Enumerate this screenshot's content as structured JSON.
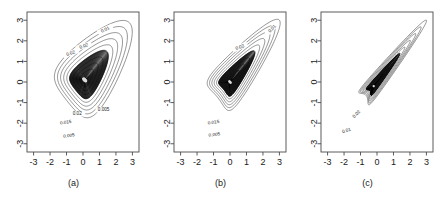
{
  "figure": {
    "type": "contour-plot-panel-figure",
    "panel_count": 3,
    "background_color": "#ffffff",
    "line_color": "#2b2b2b"
  },
  "axes": {
    "x_ticks": [
      "-3",
      "-2",
      "-1",
      "0",
      "1",
      "2",
      "3"
    ],
    "y_ticks": [
      "3",
      "2",
      "1",
      "0",
      "-1",
      "-2",
      "-3"
    ],
    "x_tick_values": [
      -3,
      -2,
      -1,
      0,
      1,
      2,
      3
    ],
    "y_tick_values": [
      3,
      2,
      1,
      0,
      -1,
      -2,
      -3
    ],
    "xlim": [
      -3.4,
      3.4
    ],
    "ylim": [
      -3.4,
      3.4
    ]
  },
  "panels": [
    {
      "id": "a",
      "caption": "(a)",
      "contour_labels": [
        "0.01",
        "0.02",
        "0.02",
        "0.005",
        "0.02",
        "0.015",
        "0.005"
      ]
    },
    {
      "id": "b",
      "caption": "(b)",
      "contour_labels": [
        "0.01",
        "0.02",
        "0.015",
        "0.005"
      ]
    },
    {
      "id": "c",
      "caption": "(c)",
      "contour_labels": [
        "0.02",
        "0.01"
      ]
    }
  ],
  "chart_data": {
    "type": "line",
    "title": "",
    "xlabel": "",
    "ylabel": "",
    "xlim": [
      -3.4,
      3.4
    ],
    "ylim": [
      -3.4,
      3.4
    ],
    "grid": false,
    "legend": "none",
    "plot_kind": "contour",
    "contour_levels": [
      0.005,
      0.01,
      0.015,
      0.02,
      0.025,
      0.03,
      0.035,
      0.04,
      0.05,
      0.06,
      0.08,
      0.1,
      0.12,
      0.15
    ],
    "labeled_levels": [
      0.005,
      0.01,
      0.015,
      0.02
    ],
    "series": [
      {
        "name": "(a)",
        "description": "Broad rounded teardrop density, moderate positive correlation, mode near (0.1, 0.1), tail extending toward (2.8, 2.8)",
        "mode": [
          0.1,
          0.1
        ],
        "correlation": 0.55,
        "sigma_major": 1.55,
        "sigma_minor": 0.95,
        "skew": 0.45,
        "tip": [
          2.85,
          2.85
        ],
        "labels": [
          "0.01",
          "0.02",
          "0.02",
          "0.005",
          "0.02",
          "0.015",
          "0.005"
        ]
      },
      {
        "name": "(b)",
        "description": "Narrower elongated teardrop, strong positive correlation, mode near (0.0, 0.0), tip reaching (3.0, 3.0)",
        "mode": [
          0.0,
          0.0
        ],
        "correlation": 0.8,
        "sigma_major": 1.75,
        "sigma_minor": 0.7,
        "skew": 0.6,
        "tip": [
          3.0,
          3.0
        ],
        "labels": [
          "0.01",
          "0.02",
          "0.015",
          "0.005"
        ]
      },
      {
        "name": "(c)",
        "description": "Very narrow needle-like teardrop, near-perfect positive correlation, concentrated along the diagonal with sharp tip at (3.0, 3.0)",
        "mode": [
          -0.2,
          -0.2
        ],
        "correlation": 0.96,
        "sigma_major": 1.85,
        "sigma_minor": 0.34,
        "skew": 0.75,
        "tip": [
          3.0,
          3.0
        ],
        "labels": [
          "0.02",
          "0.01"
        ]
      }
    ]
  }
}
